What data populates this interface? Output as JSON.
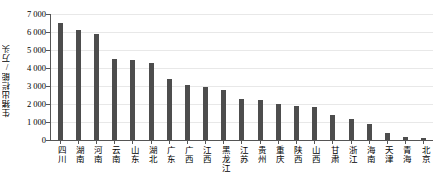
{
  "chart_data": {
    "type": "bar",
    "title": "",
    "xlabel": "",
    "ylabel": "生猪出栏能/万头",
    "ylim": [
      0,
      7000
    ],
    "grid": true,
    "legend": null,
    "ytick_labels": [
      "7 000",
      "6 000",
      "5 000",
      "4 000",
      "3 000",
      "2 000",
      "1 000",
      "0"
    ],
    "ytick_values": [
      7000,
      6000,
      5000,
      4000,
      3000,
      2000,
      1000,
      0
    ],
    "categories": [
      "四川",
      "湖南",
      "河南",
      "云南",
      "山东",
      "湖北",
      "广东",
      "广西",
      "江西",
      "黑龙江",
      "江苏",
      "贵州",
      "重庆",
      "陕西",
      "山西",
      "甘肃",
      "浙江",
      "海南",
      "天津",
      "青海",
      "北京"
    ],
    "values": [
      6500,
      6100,
      5900,
      4500,
      4450,
      4300,
      3400,
      3050,
      2950,
      2800,
      2300,
      2200,
      2000,
      1900,
      1850,
      1400,
      1150,
      900,
      400,
      150,
      120
    ],
    "series": [
      {
        "name": "生猪出栏能",
        "color": "#4d4d4d",
        "values": [
          6500,
          6100,
          5900,
          4500,
          4450,
          4300,
          3400,
          3050,
          2950,
          2800,
          2300,
          2200,
          2000,
          1900,
          1850,
          1400,
          1150,
          900,
          400,
          150,
          120
        ]
      }
    ]
  },
  "colors": {
    "bar": "#4d4d4d",
    "grid": "#e8e8e8",
    "axis": "#555555",
    "text": "#000000",
    "background": "#ffffff"
  }
}
